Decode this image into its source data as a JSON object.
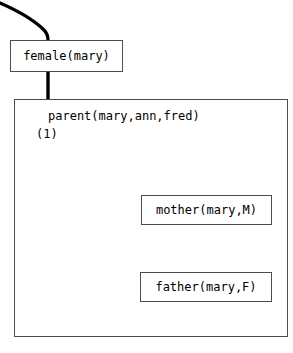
{
  "diagram": {
    "stroke_color": "#000000",
    "box_border_color": "#4d4d4d",
    "background_color": "#ffffff"
  },
  "nodes": {
    "female_goal": "female(mary)",
    "mother_goal": "mother(mary,M)",
    "father_goal": "father(mary,F)"
  },
  "frame": {
    "parent_goal": "parent(mary,ann,fred)",
    "clause_index": "(1)"
  },
  "connectors": {
    "incoming_edge_label": "",
    "female_to_frame_label": "",
    "resolution_arrow_label": ""
  }
}
